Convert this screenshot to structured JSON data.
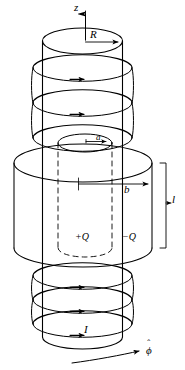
{
  "figure": {
    "background_color": "#ffffff",
    "line_color": "#000000",
    "labels": {
      "z_axis": "z",
      "solenoid_radius": "R",
      "inner_radius": "a",
      "outer_radius": "b",
      "capacitor_length": "l",
      "inner_charge": "+Q",
      "outer_charge": "−Q",
      "current": "I",
      "phi_unit_vector": "ϕ",
      "phi_unit_vector_hat": "ˆ"
    },
    "elements": [
      {
        "name": "z-axis-arrow",
        "kind": "axis"
      },
      {
        "name": "solenoid-coil",
        "kind": "helix",
        "turns": 6
      },
      {
        "name": "solenoid-cylinder",
        "kind": "cylinder"
      },
      {
        "name": "outer-capacitor-cylinder",
        "kind": "cylinder"
      },
      {
        "name": "inner-capacitor-cylinder",
        "kind": "cylinder-dashed"
      },
      {
        "name": "radius-a-arrow",
        "kind": "dimension"
      },
      {
        "name": "radius-b-arrow",
        "kind": "dimension"
      },
      {
        "name": "length-l-bracket",
        "kind": "dimension"
      },
      {
        "name": "phi-direction-arrow",
        "kind": "curved-arrow"
      }
    ]
  }
}
